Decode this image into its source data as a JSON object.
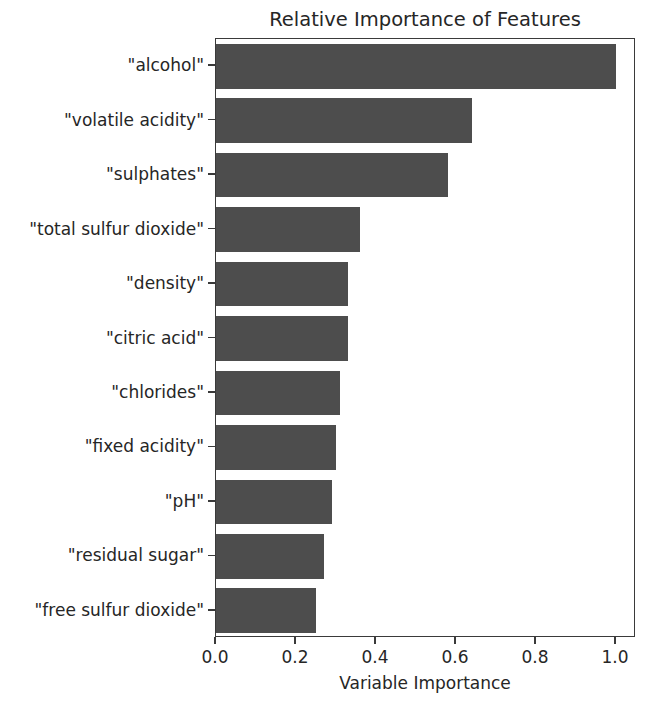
{
  "chart_data": {
    "type": "bar",
    "orientation": "horizontal",
    "title": "Relative Importance of Features",
    "xlabel": "Variable Importance",
    "ylabel": "",
    "categories": [
      "\"alcohol\"",
      "\"volatile acidity\"",
      "\"sulphates\"",
      "\"total sulfur dioxide\"",
      "\"density\"",
      "\"citric acid\"",
      "\"chlorides\"",
      "\"fixed acidity\"",
      "\"pH\"",
      "\"residual sugar\"",
      "\"free sulfur dioxide\""
    ],
    "values": [
      1.0,
      0.64,
      0.58,
      0.36,
      0.33,
      0.33,
      0.31,
      0.3,
      0.29,
      0.27,
      0.25
    ],
    "xlim": [
      0.0,
      1.05
    ],
    "xticks": [
      0.0,
      0.2,
      0.4,
      0.6,
      0.8,
      1.0
    ],
    "xtick_labels": [
      "0.0",
      "0.2",
      "0.4",
      "0.6",
      "0.8",
      "1.0"
    ],
    "grid": false,
    "legend": false,
    "bar_color": "#4d4d4d",
    "background_color": "#ffffff",
    "axis_color": "#3a3a3a",
    "text_color": "#262626"
  }
}
